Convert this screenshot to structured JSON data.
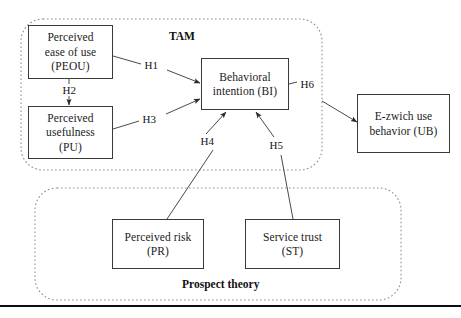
{
  "diagram": {
    "groups": [
      {
        "id": "tam",
        "label": "TAM"
      },
      {
        "id": "prospect",
        "label": "Prospect theory"
      }
    ],
    "nodes": [
      {
        "id": "peou",
        "line1": "Perceived",
        "line2": "ease of use",
        "line3": "(PEOU)"
      },
      {
        "id": "pu",
        "line1": "Perceived",
        "line2": "usefulness",
        "line3": "(PU)"
      },
      {
        "id": "bi",
        "line1": "Behavioral",
        "line2": "intention (BI)",
        "line3": ""
      },
      {
        "id": "ub",
        "line1": "E-zwich use",
        "line2": "behavior (UB)",
        "line3": ""
      },
      {
        "id": "pr",
        "line1": "Perceived risk",
        "line2": "(PR)",
        "line3": ""
      },
      {
        "id": "st",
        "line1": "Service trust",
        "line2": "(ST)",
        "line3": ""
      }
    ],
    "hypotheses": [
      {
        "id": "h1",
        "label": "H1",
        "from": "peou",
        "to": "bi"
      },
      {
        "id": "h2",
        "label": "H2",
        "from": "peou",
        "to": "pu"
      },
      {
        "id": "h3",
        "label": "H3",
        "from": "pu",
        "to": "bi"
      },
      {
        "id": "h4",
        "label": "H4",
        "from": "pr",
        "to": "bi"
      },
      {
        "id": "h5",
        "label": "H5",
        "from": "st",
        "to": "bi"
      },
      {
        "id": "h6",
        "label": "H6",
        "from": "bi",
        "to": "ub"
      }
    ],
    "colors": {
      "box_stroke": "#3a3a3a",
      "group_stroke": "#8a8a8a",
      "arrow": "#4a4a4a",
      "text": "#1a1a1a",
      "baseline": "#0d0d0d",
      "background": "#ffffff"
    }
  }
}
